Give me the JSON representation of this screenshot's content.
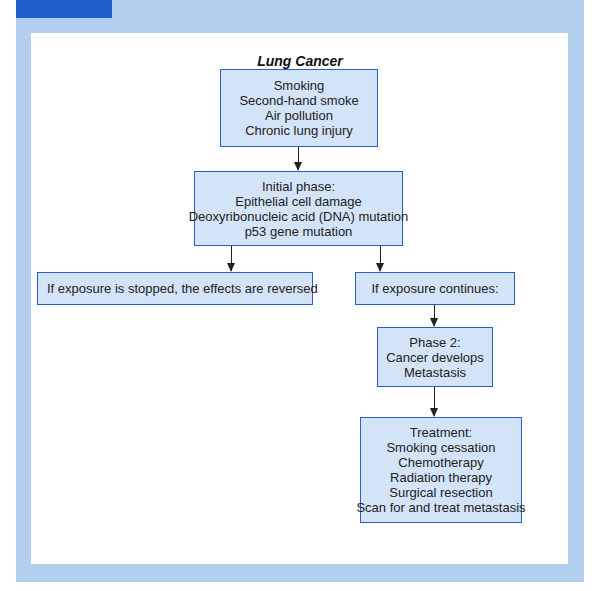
{
  "title": "Lung Cancer",
  "colors": {
    "tab": "#1f5fc9",
    "frame": "#b3cff0",
    "box_fill": "#d3e4f8",
    "box_border": "#2a5ec6"
  },
  "nodes": {
    "causes": {
      "lines": [
        "Smoking",
        "Second-hand smoke",
        "Air pollution",
        "Chronic lung injury"
      ]
    },
    "initial_phase": {
      "lines": [
        "Initial phase:",
        "Epithelial cell damage",
        "Deoxyribonucleic acid (DNA) mutation",
        "p53 gene mutation"
      ]
    },
    "exposure_stopped": {
      "lines": [
        "If exposure is stopped, the effects are reversed"
      ]
    },
    "exposure_continues": {
      "lines": [
        "If exposure continues:"
      ]
    },
    "phase2": {
      "lines": [
        "Phase 2:",
        "Cancer develops",
        "Metastasis"
      ]
    },
    "treatment": {
      "lines": [
        "Treatment:",
        "Smoking cessation",
        "Chemotherapy",
        "Radiation therapy",
        "Surgical resection",
        "Scan for and treat metastasis"
      ]
    }
  },
  "edges": [
    {
      "from": "causes",
      "to": "initial_phase"
    },
    {
      "from": "initial_phase",
      "to": "exposure_stopped"
    },
    {
      "from": "initial_phase",
      "to": "exposure_continues"
    },
    {
      "from": "exposure_continues",
      "to": "phase2"
    },
    {
      "from": "phase2",
      "to": "treatment"
    }
  ]
}
